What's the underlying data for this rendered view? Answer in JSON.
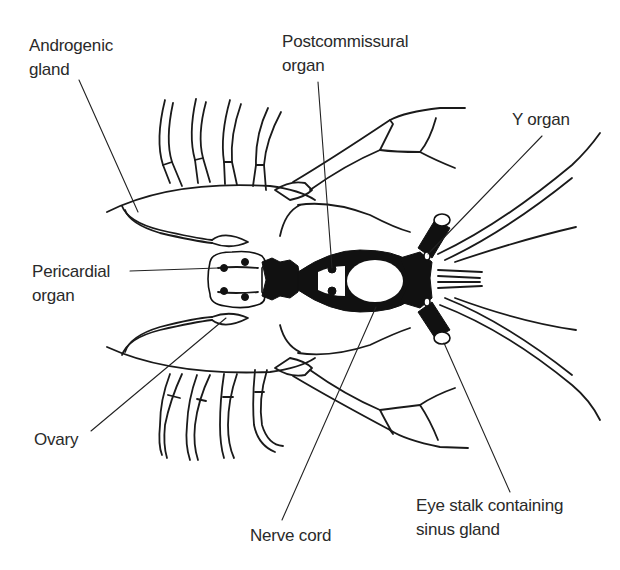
{
  "figure": {
    "labels": [
      {
        "id": "androgenic-gland",
        "lines": [
          "Androgenic",
          "gland"
        ]
      },
      {
        "id": "postcommissural-organ",
        "lines": [
          "Postcommissural",
          "organ"
        ]
      },
      {
        "id": "y-organ",
        "lines": [
          "Y organ"
        ]
      },
      {
        "id": "pericardial-organ",
        "lines": [
          "Pericardial",
          "organ"
        ]
      },
      {
        "id": "ovary",
        "lines": [
          "Ovary"
        ]
      },
      {
        "id": "nerve-cord",
        "lines": [
          "Nerve cord"
        ]
      },
      {
        "id": "eye-stalk",
        "lines": [
          "Eye stalk containing",
          "sinus gland"
        ]
      }
    ],
    "colors": {
      "ink": "#1a1a1a",
      "background": "#ffffff",
      "label_text": "#2a2a2a"
    }
  }
}
